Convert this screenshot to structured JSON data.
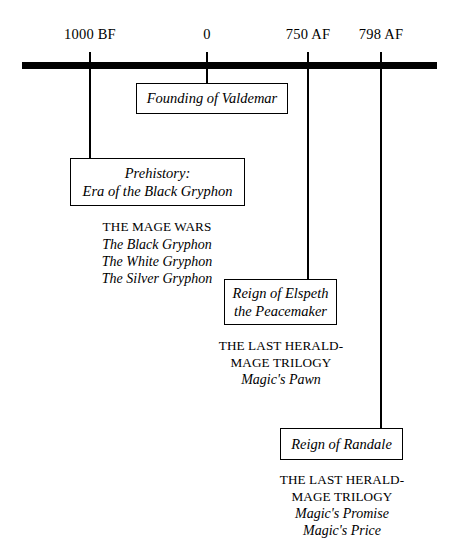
{
  "figure": {
    "type": "timeline",
    "orientation": "horizontal",
    "axis": {
      "ticks": [
        {
          "label": "1000 BF",
          "x": 90
        },
        {
          "label": "0",
          "x": 207
        },
        {
          "label": "750 AF",
          "x": 308
        },
        {
          "label": "798 AF",
          "x": 381
        }
      ]
    },
    "events": [
      {
        "id": "founding-of-valdemar",
        "tick": "0",
        "box_lines": [
          "Founding of Valdemar"
        ],
        "series_title_lines": [],
        "books": []
      },
      {
        "id": "prehistory",
        "tick": "1000 BF",
        "box_lines": [
          "Prehistory:",
          "Era of the Black Gryphon"
        ],
        "series_title_lines": [
          "THE MAGE WARS"
        ],
        "books": [
          "The Black Gryphon",
          "The White Gryphon",
          "The Silver Gryphon"
        ]
      },
      {
        "id": "reign-of-elspeth",
        "tick": "750 AF",
        "box_lines": [
          "Reign of Elspeth",
          "the Peacemaker"
        ],
        "series_title_lines": [
          "THE LAST HERALD-",
          "MAGE TRILOGY"
        ],
        "books": [
          "Magic's Pawn"
        ]
      },
      {
        "id": "reign-of-randale",
        "tick": "798 AF",
        "box_lines": [
          "Reign of Randale"
        ],
        "series_title_lines": [
          "THE LAST HERALD-",
          "MAGE TRILOGY"
        ],
        "books": [
          "Magic's Promise",
          "Magic's Price"
        ]
      }
    ],
    "colors": {
      "ink": "#000000",
      "paper": "#ffffff"
    }
  }
}
